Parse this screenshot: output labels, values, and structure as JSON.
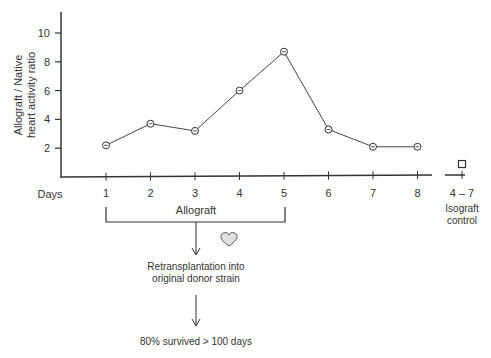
{
  "chart_data": {
    "type": "line",
    "title": "",
    "xlabel": "Days",
    "ylabel": "Allograft / Native heart activity ratio",
    "ylabel_lines": [
      "Allograft / Native",
      "heart activity ratio"
    ],
    "ylim": [
      0,
      11
    ],
    "yticks": [
      2,
      4,
      6,
      8,
      10
    ],
    "x": [
      1,
      2,
      3,
      4,
      5,
      6,
      7,
      8
    ],
    "series": [
      {
        "name": "Allograft",
        "marker": "circle",
        "values": [
          2.2,
          3.7,
          3.2,
          6.0,
          8.7,
          3.3,
          2.1,
          2.1
        ]
      }
    ],
    "control": {
      "label": "4 – 7",
      "name_lines": [
        "Isograft",
        "control"
      ],
      "marker": "square",
      "value": 0.9
    },
    "grid": false,
    "legend": "none",
    "annotations": {
      "bracket_label": "Allograft",
      "bracket_range": [
        1,
        5
      ],
      "step1": [
        "Retransplantation into",
        "original donor strain"
      ],
      "step2": "80% survived > 100 days",
      "icon": "heart-icon"
    }
  }
}
